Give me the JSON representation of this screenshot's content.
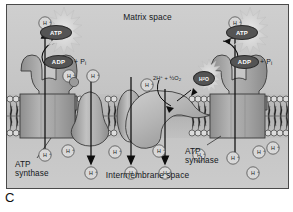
{
  "panel": {
    "letter": "C"
  },
  "figure": {
    "title_top": "Matrix space",
    "title_bottom": "Intermembrane space",
    "background_color": "#c8c8c8",
    "border_color": "#4a4a4a"
  },
  "labels": {
    "atp_synthase_left": "ATP\nsynthase",
    "atp_synthase_left_line1": "ATP",
    "atp_synthase_left_line2": "synthase",
    "atp_synthase_right_line1": "ATP",
    "atp_synthase_right_line2": "synthase",
    "phosphate_left": "+ P",
    "phosphate_right": "+ P",
    "phosphate_subscript": "i",
    "reaction": "2H+ + ½O2",
    "reaction_prefix": "2H",
    "reaction_sup": "+",
    "reaction_mid": " + ½O",
    "reaction_sub": "2"
  },
  "molecules": {
    "atp_left": "ATP",
    "atp_right": "ATP",
    "adp_left": "ADP",
    "adp_right": "ADP",
    "water": "H2O",
    "water_prefix": "H",
    "water_sub": "2",
    "water_suffix": "O",
    "proton": "H+",
    "proton_symbol": "H",
    "proton_charge": "+"
  },
  "colors": {
    "protein_fill": "#a9a9a9",
    "protein_stroke": "#3a3a3a",
    "membrane_fill": "#b0b0b0",
    "badge_fill": "#545454",
    "text": "#15181c",
    "arrow": "#111111",
    "proton_circle_fill": "#d6d6d6"
  },
  "diagram": {
    "type": "biological-schematic",
    "membrane_top_y": 92,
    "membrane_bottom_y": 132,
    "complexes": [
      {
        "name": "atp-synthase-left",
        "x": 22,
        "shape": "mushroom"
      },
      {
        "name": "complex-i",
        "x": 82,
        "shape": "pear"
      },
      {
        "name": "complex-iii",
        "x": 122,
        "shape": "oval"
      },
      {
        "name": "complex-iv",
        "x": 166,
        "shape": "comma"
      },
      {
        "name": "atp-synthase-right",
        "x": 212,
        "shape": "mushroom"
      }
    ],
    "proton_pump_arrows": [
      {
        "from": "matrix",
        "to": "intermembrane",
        "x": 84
      },
      {
        "from": "matrix",
        "to": "intermembrane",
        "x": 124
      },
      {
        "from": "matrix",
        "to": "intermembrane",
        "x": 158
      }
    ],
    "synthase_arrows": [
      {
        "from": "intermembrane",
        "to": "matrix",
        "x": 38
      },
      {
        "from": "intermembrane",
        "to": "matrix",
        "x": 228
      }
    ],
    "free_protons_matrix": 6,
    "free_protons_intermembrane": 11
  }
}
